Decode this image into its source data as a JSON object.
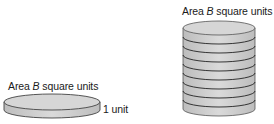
{
  "figure": {
    "left_disk": {
      "area_label_prefix": "Area ",
      "area_label_var": "B",
      "area_label_suffix": " square units",
      "height_label": "1 unit",
      "layers": 1
    },
    "right_stack": {
      "area_label_prefix": "Area ",
      "area_label_var": "B",
      "area_label_suffix": " square units",
      "layers": 9
    },
    "colors": {
      "fill_top": "#d4d4d4",
      "fill_side": "#c8c8c8",
      "stroke": "#333333"
    }
  }
}
